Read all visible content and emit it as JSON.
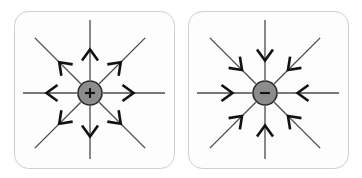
{
  "figure": {
    "name": "electric-field-lines-of-point-charges",
    "background_color": "#ffffff",
    "width": 362,
    "height": 178
  },
  "panels": [
    {
      "id": "positive-charge-panel",
      "charge_sign": "+",
      "charge_label": "+",
      "charge_polarity": "positive",
      "field_direction": "outward",
      "charge_fill_color": "#8c8c8c",
      "charge_stroke_color": "#2b2b2b",
      "line_color": "#4a4a4a",
      "arrow_color": "#111111",
      "panel_fill_color": "#fdfdfd",
      "panel_border_color": "#cfcfcf",
      "center_x": 90,
      "center_y": 93,
      "charge_radius": 12,
      "box": {
        "x": 14,
        "y": 11,
        "width": 160,
        "height": 157,
        "radius": 14
      },
      "field_lines": [
        {
          "name": "field-line-east",
          "angle_deg": 0
        },
        {
          "name": "field-line-northeast",
          "angle_deg": 315
        },
        {
          "name": "field-line-north",
          "angle_deg": 270
        },
        {
          "name": "field-line-northwest",
          "angle_deg": 225
        },
        {
          "name": "field-line-west",
          "angle_deg": 180
        },
        {
          "name": "field-line-southwest",
          "angle_deg": 135
        },
        {
          "name": "field-line-south",
          "angle_deg": 90
        },
        {
          "name": "field-line-southeast",
          "angle_deg": 45
        }
      ]
    },
    {
      "id": "negative-charge-panel",
      "charge_sign": "−",
      "charge_label": "−",
      "charge_polarity": "negative",
      "field_direction": "inward",
      "charge_fill_color": "#8c8c8c",
      "charge_stroke_color": "#2b2b2b",
      "line_color": "#4a4a4a",
      "arrow_color": "#111111",
      "panel_fill_color": "#fdfdfd",
      "panel_border_color": "#cfcfcf",
      "center_x": 265,
      "center_y": 93,
      "charge_radius": 12,
      "box": {
        "x": 188,
        "y": 11,
        "width": 160,
        "height": 157,
        "radius": 14
      },
      "field_lines": [
        {
          "name": "field-line-east",
          "angle_deg": 0
        },
        {
          "name": "field-line-northeast",
          "angle_deg": 315
        },
        {
          "name": "field-line-north",
          "angle_deg": 270
        },
        {
          "name": "field-line-northwest",
          "angle_deg": 225
        },
        {
          "name": "field-line-west",
          "angle_deg": 180
        },
        {
          "name": "field-line-southwest",
          "angle_deg": 135
        },
        {
          "name": "field-line-south",
          "angle_deg": 90
        },
        {
          "name": "field-line-southeast",
          "angle_deg": 45
        }
      ]
    }
  ],
  "geometry": {
    "line_inner_radius": 13,
    "line_outer_radius": 78,
    "arrow_position_radius": 38,
    "arrow_half_width": 8,
    "arrow_length": 11,
    "line_width": 1.3,
    "arrow_line_width": 2.6
  }
}
